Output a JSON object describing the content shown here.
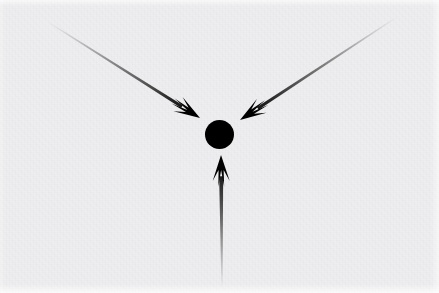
{
  "figure": {
    "width": 439,
    "height": 293,
    "background_color": "#eeeef0",
    "ink_color": "#000000"
  },
  "chart_data": {
    "type": "diagram",
    "xlabel": "",
    "ylabel": "",
    "xlim": [
      0,
      439
    ],
    "ylim": [
      0,
      293
    ],
    "grid": false,
    "legend": "none",
    "background_color": "#eeeef0",
    "focal_point": {
      "name": "center-dot",
      "shape": "circle",
      "cx": 219.5,
      "cy": 134.5,
      "r": 14.5,
      "color": "#000000"
    },
    "arrows": [
      {
        "name": "arrow-from-upper-left",
        "direction": "down-right",
        "tail_x": 48,
        "tail_y": 22,
        "tip_x": 200,
        "tip_y": 118,
        "angle_deg": 32,
        "shaft_width_px": 3.2,
        "head_length_px": 26,
        "head_width_px": 17,
        "fade": "transparent-at-tail-to-black-at-head",
        "color": "#000000"
      },
      {
        "name": "arrow-from-upper-right",
        "direction": "down-left",
        "tail_x": 397,
        "tail_y": 17,
        "tip_x": 240,
        "tip_y": 120,
        "angle_deg": 213,
        "shaft_width_px": 3.2,
        "head_length_px": 26,
        "head_width_px": 17,
        "fade": "transparent-at-tail-to-black-at-head",
        "color": "#000000"
      },
      {
        "name": "arrow-from-below",
        "direction": "up",
        "tail_x": 222,
        "tail_y": 288,
        "tip_x": 221,
        "tip_y": 155,
        "angle_deg": 270,
        "shaft_width_px": 4.0,
        "head_length_px": 26,
        "head_width_px": 17,
        "fade": "transparent-at-tail-to-black-at-head",
        "color": "#000000"
      }
    ],
    "annotations": []
  }
}
